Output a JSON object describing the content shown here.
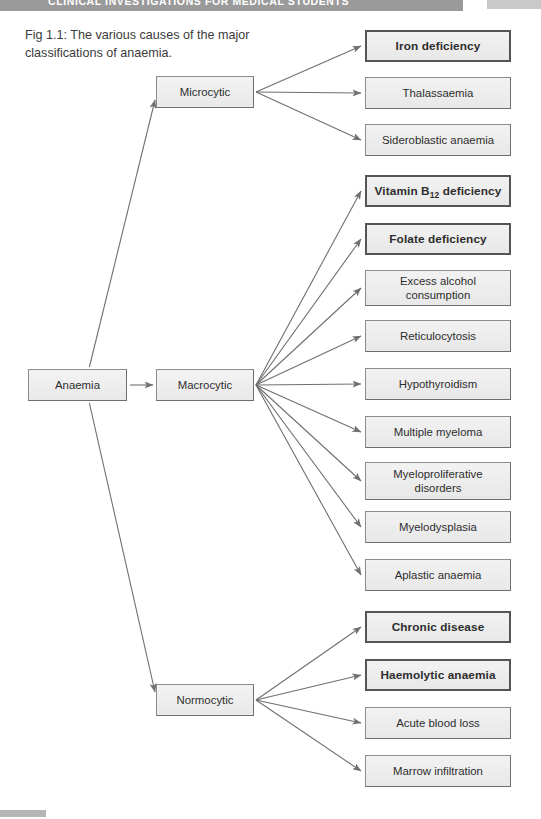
{
  "page": {
    "header_title": "CLINICAL INVESTIGATIONS FOR MEDICAL STUDENTS",
    "caption": "Fig 1.1: The various causes of the major classifications of anaemia."
  },
  "colors": {
    "header_bar": "#9a9a9a",
    "node_fill": "#efefef",
    "node_border": "#8c8c8c",
    "bold_border": "#555555",
    "arrow": "#6f6f6f",
    "text": "#2d2d2d"
  },
  "diagram": {
    "root": {
      "label": "Anaemia",
      "x": 28,
      "y": 369,
      "w": 99,
      "h": 32
    },
    "stages": [
      {
        "label": "Microcytic",
        "x": 156,
        "y": 76,
        "w": 98,
        "h": 32
      },
      {
        "label": "Macrocytic",
        "x": 156,
        "y": 369,
        "w": 98,
        "h": 32
      },
      {
        "label": "Normocytic",
        "x": 156,
        "y": 684,
        "w": 98,
        "h": 32
      }
    ],
    "branches": [
      {
        "stage": "Microcytic",
        "causes": [
          {
            "label": "Iron deficiency",
            "bold": true,
            "x": 365,
            "y": 30,
            "w": 146,
            "h": 32
          },
          {
            "label": "Thalassaemia",
            "bold": false,
            "x": 365,
            "y": 77,
            "w": 146,
            "h": 32
          },
          {
            "label": "Sideroblastic anaemia",
            "bold": false,
            "x": 365,
            "y": 124,
            "w": 146,
            "h": 32
          }
        ]
      },
      {
        "stage": "Macrocytic",
        "causes": [
          {
            "label": "Vitamin B12 deficiency",
            "label_html": "Vitamin B<sub>12</sub> deficiency",
            "bold": true,
            "x": 365,
            "y": 175,
            "w": 146,
            "h": 32
          },
          {
            "label": "Folate deficiency",
            "bold": true,
            "x": 365,
            "y": 223,
            "w": 146,
            "h": 32
          },
          {
            "label": "Excess alcohol consumption",
            "bold": false,
            "x": 365,
            "y": 270,
            "w": 146,
            "h": 36
          },
          {
            "label": "Reticulocytosis",
            "bold": false,
            "x": 365,
            "y": 320,
            "w": 146,
            "h": 32
          },
          {
            "label": "Hypothyroidism",
            "bold": false,
            "x": 365,
            "y": 368,
            "w": 146,
            "h": 32
          },
          {
            "label": "Multiple myeloma",
            "bold": false,
            "x": 365,
            "y": 416,
            "w": 146,
            "h": 32
          },
          {
            "label": "Myeloproliferative disorders",
            "bold": false,
            "x": 365,
            "y": 462,
            "w": 146,
            "h": 38
          },
          {
            "label": "Myelodysplasia",
            "bold": false,
            "x": 365,
            "y": 511,
            "w": 146,
            "h": 32
          },
          {
            "label": "Aplastic anaemia",
            "bold": false,
            "x": 365,
            "y": 559,
            "w": 146,
            "h": 32
          }
        ]
      },
      {
        "stage": "Normocytic",
        "causes": [
          {
            "label": "Chronic disease",
            "bold": true,
            "x": 365,
            "y": 611,
            "w": 146,
            "h": 32
          },
          {
            "label": "Haemolytic anaemia",
            "bold": true,
            "x": 365,
            "y": 659,
            "w": 146,
            "h": 32
          },
          {
            "label": "Acute blood loss",
            "bold": false,
            "x": 365,
            "y": 707,
            "w": 146,
            "h": 32
          },
          {
            "label": "Marrow infiltration",
            "bold": false,
            "x": 365,
            "y": 755,
            "w": 146,
            "h": 32
          }
        ]
      }
    ]
  }
}
